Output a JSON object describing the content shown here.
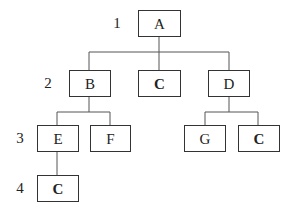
{
  "diagram": {
    "type": "tree",
    "levels": [
      {
        "label": "1",
        "y": 23
      },
      {
        "label": "2",
        "y": 83
      },
      {
        "label": "3",
        "y": 138
      },
      {
        "label": "4",
        "y": 188
      }
    ],
    "nodes": [
      {
        "id": "A",
        "label": "A",
        "bold": false,
        "level": 1,
        "x": 138,
        "y": 10,
        "w": 42,
        "h": 26
      },
      {
        "id": "B",
        "label": "B",
        "bold": false,
        "level": 2,
        "x": 69,
        "y": 70,
        "w": 41,
        "h": 26
      },
      {
        "id": "C1",
        "label": "C",
        "bold": true,
        "level": 2,
        "x": 138,
        "y": 70,
        "w": 42,
        "h": 26
      },
      {
        "id": "D",
        "label": "D",
        "bold": false,
        "level": 2,
        "x": 208,
        "y": 70,
        "w": 41,
        "h": 26
      },
      {
        "id": "E",
        "label": "E",
        "bold": false,
        "level": 3,
        "x": 37,
        "y": 125,
        "w": 41,
        "h": 26
      },
      {
        "id": "F",
        "label": "F",
        "bold": false,
        "level": 3,
        "x": 90,
        "y": 125,
        "w": 40,
        "h": 26
      },
      {
        "id": "G",
        "label": "G",
        "bold": false,
        "level": 3,
        "x": 184,
        "y": 125,
        "w": 41,
        "h": 26
      },
      {
        "id": "C2",
        "label": "C",
        "bold": true,
        "level": 3,
        "x": 238,
        "y": 125,
        "w": 41,
        "h": 26
      },
      {
        "id": "C3",
        "label": "C",
        "bold": true,
        "level": 4,
        "x": 37,
        "y": 175,
        "w": 41,
        "h": 26
      }
    ],
    "edges": [
      {
        "from": "A",
        "to": "B"
      },
      {
        "from": "A",
        "to": "C1"
      },
      {
        "from": "A",
        "to": "D"
      },
      {
        "from": "B",
        "to": "E"
      },
      {
        "from": "B",
        "to": "F"
      },
      {
        "from": "D",
        "to": "G"
      },
      {
        "from": "D",
        "to": "C2"
      },
      {
        "from": "E",
        "to": "C3"
      }
    ]
  }
}
